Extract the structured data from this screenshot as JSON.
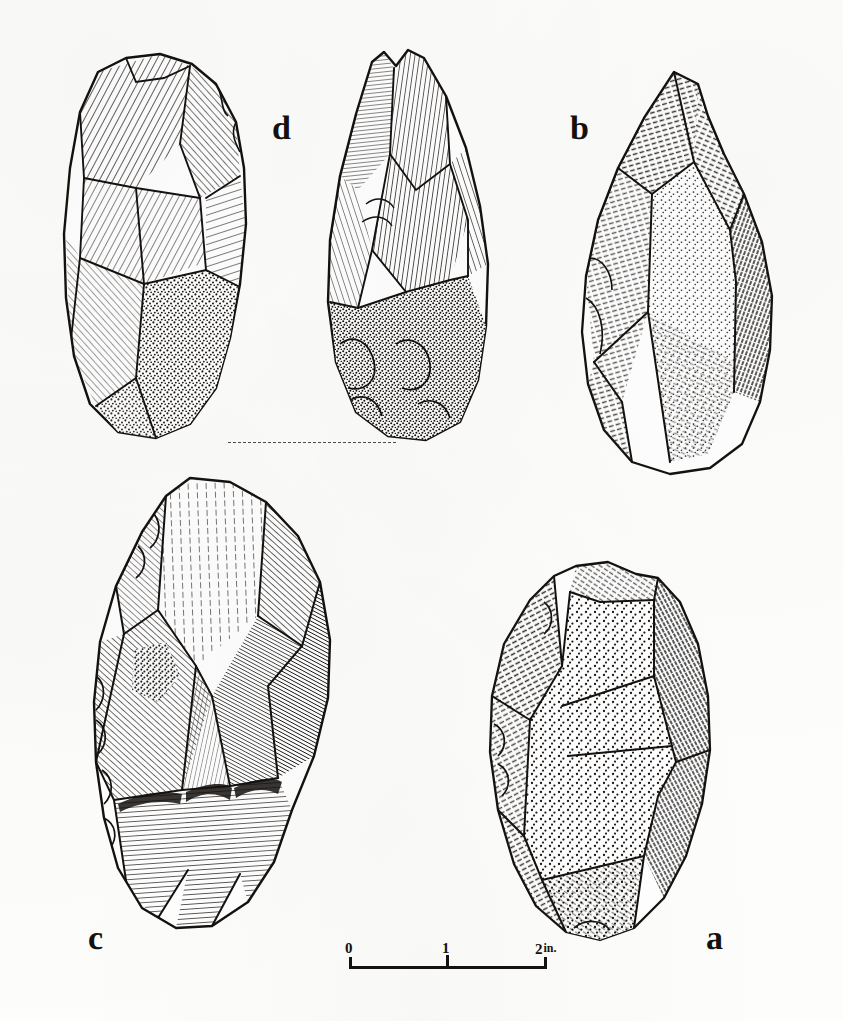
{
  "plate": {
    "kind": "archaeological-line-drawing-plate",
    "background_color": "#fdfdfb",
    "ink_color": "#14110f",
    "width": 843,
    "height": 1021
  },
  "figures": [
    {
      "id": "d-left",
      "label": "d",
      "label_text": "d",
      "caption_letter": "d",
      "name": "handaxe-d-face-view",
      "description": "Pointed handaxe, obverse face: flaked upper two thirds with fan-shaped hatching, stippled cortex butt at base"
    },
    {
      "id": "d-right",
      "label": "d",
      "label_text": "d",
      "caption_letter": "d",
      "name": "handaxe-d-profile-view",
      "description": "Same handaxe d, second view: narrow pointed tip, long parallel flake scars, heavy stippled cortex butt"
    },
    {
      "id": "b",
      "label": "b",
      "label_text": "b",
      "caption_letter": "b",
      "name": "handaxe-b",
      "description": "Large triangular pointed implement, fine short-dash shading with stippled central panel"
    },
    {
      "id": "c",
      "label": "c",
      "label_text": "c",
      "caption_letter": "c",
      "name": "handaxe-c",
      "description": "Ovate handaxe, bifacially flaked, deep dense hatching on right side and scalloped flake scars along lower edge"
    },
    {
      "id": "a",
      "label": "a",
      "label_text": "a",
      "caption_letter": "a",
      "name": "handaxe-a",
      "description": "Ovate handaxe with large stippled cortex face and hatched flaked margins"
    }
  ],
  "labels": {
    "a": "a",
    "b": "b",
    "c": "c",
    "d": "d"
  },
  "scale": {
    "name": "scale-bar",
    "ticks": [
      "0",
      "1",
      "2"
    ],
    "tick_0": "0",
    "tick_1": "1",
    "tick_2": "2",
    "unit": "in.",
    "full_text": "0 1 2 in.",
    "divisions": 2,
    "length_inches": 2
  },
  "baseline": {
    "name": "dashed-baseline",
    "style": "dashed",
    "note": "dashed ground line joining the bases of the two views of implement d"
  }
}
